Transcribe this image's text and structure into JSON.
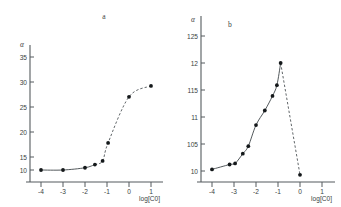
{
  "figure": {
    "background": "#ffffff",
    "ink_color": "#3a3f42",
    "point_color": "#14181a"
  },
  "panels": [
    {
      "letter": "a",
      "y_axis_label": "α",
      "x_axis_label": "log[C0]"
    },
    {
      "letter": "b",
      "y_axis_label": "α",
      "x_axis_label": "log[C0]"
    }
  ],
  "chart_data": [
    {
      "type": "line",
      "title": "a",
      "xlabel": "log[C0]",
      "ylabel": "α",
      "xlim": [
        -4.6,
        1.6
      ],
      "ylim": [
        0.93,
        3.72
      ],
      "xticks": [
        -4,
        -3,
        -2,
        -1,
        0,
        1
      ],
      "xticklabels": [
        "-4",
        "-3",
        "-2",
        "-1",
        "0",
        "1"
      ],
      "yticks": [
        1.0,
        1.5,
        2.0,
        2.5,
        3.0,
        3.5
      ],
      "yticklabels": [
        "10",
        "15",
        "20",
        "25",
        "30",
        "35"
      ],
      "grid": false,
      "legend": "none",
      "series": [
        {
          "name": "alpha vs log[C0]",
          "marker": "filled-circle",
          "x": [
            -4.0,
            -3.0,
            -2.0,
            -1.55,
            -1.2,
            -0.95,
            0.0,
            1.0
          ],
          "y": [
            1.0,
            1.0,
            1.05,
            1.12,
            1.2,
            1.6,
            2.62,
            2.86
          ],
          "solid_segment_x": [
            -4.0,
            -3.0,
            -2.0,
            -1.55
          ],
          "dashed_segment_x": [
            -1.55,
            -1.2,
            -0.95,
            0.0,
            1.0
          ]
        }
      ]
    },
    {
      "type": "line",
      "title": "b",
      "xlabel": "log[C0]",
      "ylabel": "α",
      "xlim": [
        -4.6,
        1.6
      ],
      "ylim": [
        0.975,
        1.268
      ],
      "xticks": [
        -4,
        -3,
        -2,
        -1,
        0,
        1
      ],
      "xticklabels": [
        "-4",
        "-3",
        "-2",
        "-1",
        "0",
        "1"
      ],
      "yticks": [
        1.0,
        1.05,
        1.1,
        1.15,
        1.2,
        1.25
      ],
      "yticklabels": [
        "10",
        "105",
        "11",
        "115",
        "12",
        "125"
      ],
      "grid": false,
      "legend": "none",
      "series": [
        {
          "name": "alpha vs log[C0]",
          "marker": "filled-circle",
          "x": [
            -4.0,
            -3.2,
            -2.95,
            -2.6,
            -2.35,
            -2.0,
            -1.6,
            -1.25,
            -1.05,
            -0.88,
            0.0
          ],
          "y": [
            1.003,
            1.012,
            1.014,
            1.032,
            1.046,
            1.085,
            1.112,
            1.139,
            1.159,
            1.2,
            0.993
          ],
          "solid_segment_x": [
            -4.0,
            -3.2,
            -2.95,
            -2.6,
            -2.35,
            -2.0,
            -1.6,
            -1.25,
            -1.05,
            -0.88
          ],
          "dashed_segment_x": [
            -0.88,
            0.0
          ]
        }
      ]
    }
  ]
}
